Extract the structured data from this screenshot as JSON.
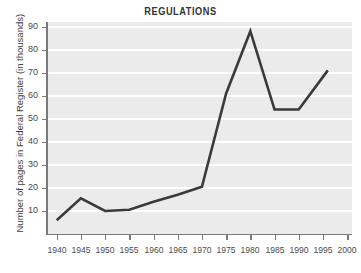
{
  "chart_data": {
    "type": "line",
    "title": "REGULATIONS",
    "xlabel": "",
    "ylabel": "Number of pages in Federal Register (in thousands)",
    "x": [
      1940,
      1945,
      1950,
      1955,
      1960,
      1965,
      1970,
      1975,
      1980,
      1985,
      1990,
      1996
    ],
    "values": [
      6,
      15.5,
      10,
      10.5,
      14,
      17,
      20.5,
      61,
      88,
      54,
      54,
      71
    ],
    "series": [
      {
        "name": "Pages in Federal Register",
        "values": [
          6,
          15.5,
          10,
          10.5,
          14,
          17,
          20.5,
          61,
          88,
          54,
          54,
          71
        ]
      }
    ],
    "xlim": [
      1938,
      2001
    ],
    "ylim": [
      0,
      92
    ],
    "xticks": [
      1940,
      1945,
      1950,
      1955,
      1960,
      1965,
      1970,
      1975,
      1980,
      1985,
      1990,
      1995,
      2000
    ],
    "xtick_labels": [
      "1940",
      "1945",
      "1950",
      "1955",
      "1960",
      "1965",
      "1970",
      "1975",
      "1980",
      "1985",
      "1990",
      "1995",
      "2000"
    ],
    "yticks": [
      10,
      20,
      30,
      40,
      50,
      60,
      70,
      80,
      90
    ],
    "ytick_labels": [
      "10",
      "20",
      "30",
      "40",
      "50",
      "60",
      "70",
      "80",
      "90"
    ],
    "grid": "horizontal",
    "legend": "none",
    "colors": {
      "line": "#3a3a3a",
      "plot_background": "#ebebeb",
      "gridline": "#ffffff",
      "axis": "#7a7a7a",
      "page_background": "#ffffff",
      "title_text": "#333333",
      "tick_text": "#4a4a4a"
    }
  }
}
